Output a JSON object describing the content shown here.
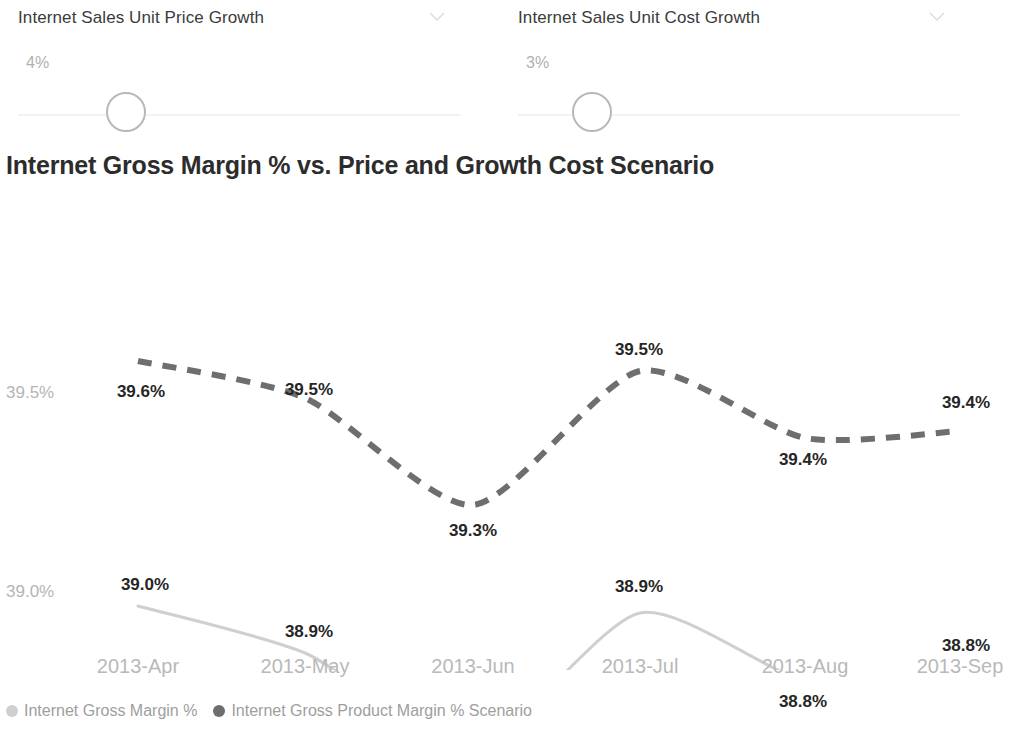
{
  "slicers": [
    {
      "title": "Internet Sales Unit Price Growth",
      "value": "4%",
      "chevron_icon": "chevron-down-icon"
    },
    {
      "title": "Internet Sales Unit Cost Growth",
      "value": "3%",
      "chevron_icon": "chevron-down-icon"
    }
  ],
  "chart": {
    "title": "Internet Gross Margin % vs. Price and Growth Cost Scenario"
  },
  "legend": [
    {
      "label": "Internet Gross Margin %",
      "color": "#cfcfcf"
    },
    {
      "label": "Internet Gross Product Margin % Scenario",
      "color": "#6e6e6e"
    }
  ],
  "chart_data": {
    "type": "line",
    "title": "Internet Gross Margin % vs. Price and Growth Cost Scenario",
    "xlabel": "",
    "ylabel": "",
    "grid": false,
    "legend_position": "bottom",
    "categories": [
      "2013-Apr",
      "2013-May",
      "2013-Jun",
      "2013-Jul",
      "2013-Aug",
      "2013-Sep"
    ],
    "ytick_labels": [
      "39.5%",
      "39.0%"
    ],
    "ytick_values": [
      39.5,
      39.0
    ],
    "ylim": [
      38.6,
      39.7
    ],
    "series": [
      {
        "name": "Internet Gross Product Margin % Scenario",
        "color": "#6e6e6e",
        "style": "dashed",
        "values": [
          39.6,
          39.5,
          39.3,
          39.5,
          39.4,
          39.4
        ],
        "labels": [
          "39.6%",
          "39.5%",
          "39.3%",
          "39.5%",
          "39.4%",
          "39.4%"
        ]
      },
      {
        "name": "Internet Gross Margin %",
        "color": "#cfcfcf",
        "style": "solid",
        "values": [
          39.0,
          38.9,
          38.7,
          38.9,
          38.8,
          38.8
        ],
        "labels": [
          "39.0%",
          "38.9%",
          "38.7%",
          "38.9%",
          "38.8%",
          "38.8%"
        ]
      }
    ],
    "point_pixels": {
      "x": [
        138,
        305,
        473,
        640,
        805,
        960
      ],
      "scenario_y": [
        221,
        258,
        365,
        231,
        298,
        291
      ],
      "actual_y": [
        466,
        513,
        607,
        473,
        540,
        532
      ]
    },
    "label_positions": {
      "scenario": [
        {
          "text": "39.6%",
          "x": 141,
          "y": 242
        },
        {
          "text": "39.5%",
          "x": 309,
          "y": 240
        },
        {
          "text": "39.3%",
          "x": 473,
          "y": 381
        },
        {
          "text": "39.5%",
          "x": 639,
          "y": 200
        },
        {
          "text": "39.4%",
          "x": 803,
          "y": 310
        },
        {
          "text": "39.4%",
          "x": 966,
          "y": 253
        }
      ],
      "actual": [
        {
          "text": "39.0%",
          "x": 145,
          "y": 435
        },
        {
          "text": "38.9%",
          "x": 309,
          "y": 482
        },
        {
          "text": "38.7%",
          "x": 473,
          "y": 620
        },
        {
          "text": "38.9%",
          "x": 639,
          "y": 437
        },
        {
          "text": "38.8%",
          "x": 803,
          "y": 552
        },
        {
          "text": "38.8%",
          "x": 966,
          "y": 496
        }
      ]
    },
    "y_axis_label_positions": [
      {
        "text": "39.5%",
        "x": 6,
        "y": 243
      },
      {
        "text": "39.0%",
        "x": 6,
        "y": 442
      }
    ]
  }
}
